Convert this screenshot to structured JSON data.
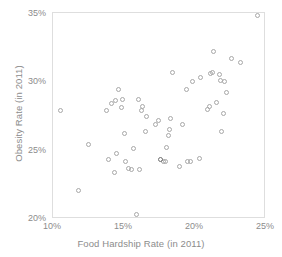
{
  "chart_data": {
    "type": "scatter",
    "title": "",
    "xlabel": "Food Hardship Rate (in 2011)",
    "ylabel": "Obesity Rate (in 2011)",
    "xlim": [
      10,
      25
    ],
    "ylim": [
      20,
      35
    ],
    "xticks": [
      "10%",
      "15%",
      "20%",
      "25%"
    ],
    "xtick_values": [
      10,
      15,
      20,
      25
    ],
    "yticks": [
      "20%",
      "25%",
      "30%",
      "35%"
    ],
    "ytick_values": [
      20,
      25,
      30,
      35
    ],
    "grid": false,
    "legend": null,
    "marker": "open-circle",
    "marker_color": "#a8a8a8",
    "frame_color": "#dedede",
    "text_color": "#8c8c8c",
    "points": [
      {
        "x": 10.5,
        "y": 27.9
      },
      {
        "x": 11.8,
        "y": 22.1
      },
      {
        "x": 12.5,
        "y": 25.4
      },
      {
        "x": 13.8,
        "y": 27.9
      },
      {
        "x": 13.9,
        "y": 24.3
      },
      {
        "x": 14.1,
        "y": 28.4
      },
      {
        "x": 14.3,
        "y": 23.4
      },
      {
        "x": 14.4,
        "y": 28.6
      },
      {
        "x": 14.5,
        "y": 24.8
      },
      {
        "x": 14.6,
        "y": 29.4
      },
      {
        "x": 14.8,
        "y": 28.1
      },
      {
        "x": 14.9,
        "y": 28.7
      },
      {
        "x": 15.0,
        "y": 26.2
      },
      {
        "x": 15.1,
        "y": 24.2
      },
      {
        "x": 15.3,
        "y": 23.7
      },
      {
        "x": 15.5,
        "y": 23.6
      },
      {
        "x": 15.7,
        "y": 25.1
      },
      {
        "x": 15.9,
        "y": 20.3
      },
      {
        "x": 16.0,
        "y": 28.7
      },
      {
        "x": 16.1,
        "y": 23.6
      },
      {
        "x": 16.2,
        "y": 27.9
      },
      {
        "x": 16.3,
        "y": 28.2
      },
      {
        "x": 16.5,
        "y": 26.4
      },
      {
        "x": 16.6,
        "y": 27.5
      },
      {
        "x": 17.2,
        "y": 26.9
      },
      {
        "x": 17.4,
        "y": 27.2
      },
      {
        "x": 17.8,
        "y": 24.2
      },
      {
        "x": 17.9,
        "y": 24.2
      },
      {
        "x": 18.0,
        "y": 25.2
      },
      {
        "x": 18.1,
        "y": 26.1
      },
      {
        "x": 18.2,
        "y": 26.5
      },
      {
        "x": 18.3,
        "y": 27.3
      },
      {
        "x": 18.4,
        "y": 30.7
      },
      {
        "x": 18.9,
        "y": 23.8
      },
      {
        "x": 19.1,
        "y": 26.9
      },
      {
        "x": 19.4,
        "y": 29.4
      },
      {
        "x": 19.5,
        "y": 24.2
      },
      {
        "x": 19.7,
        "y": 24.2
      },
      {
        "x": 19.8,
        "y": 30.0
      },
      {
        "x": 20.3,
        "y": 24.4
      },
      {
        "x": 20.4,
        "y": 30.3
      },
      {
        "x": 20.9,
        "y": 28.0
      },
      {
        "x": 21.0,
        "y": 28.2
      },
      {
        "x": 21.1,
        "y": 30.6
      },
      {
        "x": 21.2,
        "y": 30.7
      },
      {
        "x": 21.3,
        "y": 32.2
      },
      {
        "x": 21.5,
        "y": 28.5
      },
      {
        "x": 21.7,
        "y": 30.5
      },
      {
        "x": 21.8,
        "y": 30.1
      },
      {
        "x": 21.9,
        "y": 26.4
      },
      {
        "x": 22.0,
        "y": 27.7
      },
      {
        "x": 22.1,
        "y": 30.0
      },
      {
        "x": 22.2,
        "y": 29.2
      },
      {
        "x": 22.6,
        "y": 31.7
      },
      {
        "x": 23.2,
        "y": 31.4
      },
      {
        "x": 24.4,
        "y": 34.8
      }
    ],
    "dark_points": [
      {
        "x": 17.6,
        "y": 24.3
      }
    ]
  }
}
